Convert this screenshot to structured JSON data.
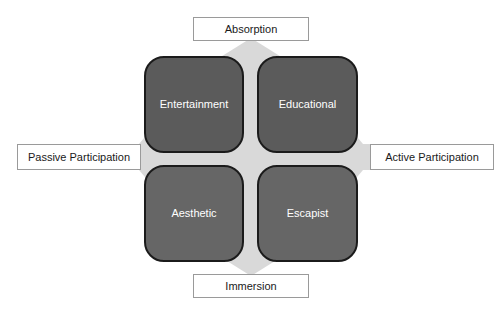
{
  "diagram": {
    "axes": {
      "top": {
        "label": "Absorption"
      },
      "bottom": {
        "label": "Immersion"
      },
      "left": {
        "label": "Passive Participation"
      },
      "right": {
        "label": "Active Participation"
      }
    },
    "quadrants": [
      {
        "id": "entertainment",
        "label": "Entertainment",
        "position": "top-left",
        "fill": "#5b5b5b"
      },
      {
        "id": "educational",
        "label": "Educational",
        "position": "top-right",
        "fill": "#5b5b5b"
      },
      {
        "id": "aesthetic",
        "label": "Aesthetic",
        "position": "bottom-left",
        "fill": "#666666"
      },
      {
        "id": "escapist",
        "label": "Escapist",
        "position": "bottom-right",
        "fill": "#666666"
      }
    ],
    "colors": {
      "cross_fill": "#d9d9d9",
      "quadrant_border": "#1b1b1b",
      "label_border": "#9a9a9a",
      "label_background": "#ffffff",
      "quadrant_text": "#ffffff",
      "label_text": "#1a1a1a",
      "page_background": "#ffffff"
    }
  }
}
